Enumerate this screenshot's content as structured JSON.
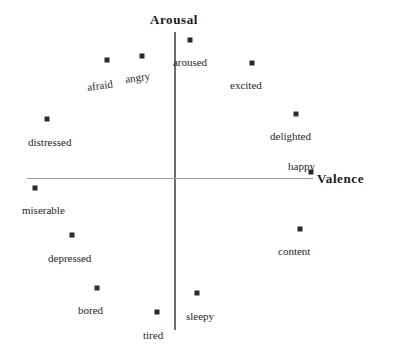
{
  "figure": {
    "width": 395,
    "height": 345,
    "background": "#ffffff",
    "marker_color": "#2b2b2b",
    "axis_color": "#6e6e6e",
    "axis_title_color": "#1a1a1a",
    "label_color": "#262626"
  },
  "axes": {
    "x_title": "Valence",
    "y_title": "Arousal",
    "origin": {
      "x": 174,
      "y": 178
    },
    "x_line": {
      "x1": 27,
      "x2": 313,
      "y": 178
    },
    "y_line": {
      "x": 174,
      "y1": 32,
      "y2": 330
    },
    "x_title_pos": {
      "x": 317,
      "y": 171
    },
    "y_title_pos": {
      "x": 174,
      "y": 12
    }
  },
  "chart_data": {
    "type": "scatter",
    "title": "",
    "subtitle": "",
    "xlabel": "Valence",
    "ylabel": "Arousal",
    "grid": false,
    "legend": "none",
    "axis_origin_px": {
      "x": 174,
      "y": 178
    },
    "xlim": [
      -1,
      1
    ],
    "ylim": [
      -1,
      1
    ],
    "note": "Circumplex model of affect: 12 emotion words plotted in valence-arousal space. Coordinates normalized to [-1,1] from pixel positions about the axis origin.",
    "points": [
      {
        "label": "aroused",
        "px": 190,
        "py": 40,
        "x": 0.115,
        "y": 0.903,
        "label_x": 190,
        "label_y": 57,
        "label_anchor": "center",
        "rotate": 0
      },
      {
        "label": "angry",
        "px": 142,
        "py": 56,
        "x": -0.23,
        "y": 0.798,
        "label_x": 126,
        "label_y": 74,
        "label_anchor": "start",
        "rotate": -8
      },
      {
        "label": "afraid",
        "px": 107,
        "py": 60,
        "x": -0.469,
        "y": 0.772,
        "label_x": 88,
        "label_y": 82,
        "label_anchor": "start",
        "rotate": -8
      },
      {
        "label": "excited",
        "px": 252,
        "py": 63,
        "x": 0.531,
        "y": 0.752,
        "label_x": 230,
        "label_y": 80,
        "label_anchor": "start",
        "rotate": 0
      },
      {
        "label": "delighted",
        "px": 296,
        "py": 114,
        "x": 0.832,
        "y": 0.418,
        "label_x": 270,
        "label_y": 131,
        "label_anchor": "start",
        "rotate": 0
      },
      {
        "label": "distressed",
        "px": 47,
        "py": 119,
        "x": -0.864,
        "y": 0.386,
        "label_x": 28,
        "label_y": 137,
        "label_anchor": "start",
        "rotate": 0
      },
      {
        "label": "happy",
        "px": 311,
        "py": 172,
        "x": 0.935,
        "y": 0.039,
        "label_x": 288,
        "label_y": 161,
        "label_anchor": "start",
        "rotate": 0
      },
      {
        "label": "miserable",
        "px": 35,
        "py": 188,
        "x": -0.946,
        "y": -0.065,
        "label_x": 22,
        "label_y": 205,
        "label_anchor": "start",
        "rotate": 0
      },
      {
        "label": "content",
        "px": 300,
        "py": 229,
        "x": 0.86,
        "y": -0.334,
        "label_x": 278,
        "label_y": 246,
        "label_anchor": "start",
        "rotate": 0
      },
      {
        "label": "depressed",
        "px": 72,
        "py": 235,
        "x": -0.695,
        "y": -0.373,
        "label_x": 48,
        "label_y": 253,
        "label_anchor": "start",
        "rotate": 0
      },
      {
        "label": "bored",
        "px": 97,
        "py": 288,
        "x": -0.524,
        "y": -0.719,
        "label_x": 78,
        "label_y": 305,
        "label_anchor": "start",
        "rotate": 0
      },
      {
        "label": "sleepy",
        "px": 197,
        "py": 293,
        "x": 0.161,
        "y": -0.752,
        "label_x": 186,
        "label_y": 311,
        "label_anchor": "start",
        "rotate": 0
      },
      {
        "label": "tired",
        "px": 157,
        "py": 312,
        "x": -0.109,
        "y": -0.876,
        "label_x": 143,
        "label_y": 330,
        "label_anchor": "start",
        "rotate": 0
      }
    ]
  }
}
